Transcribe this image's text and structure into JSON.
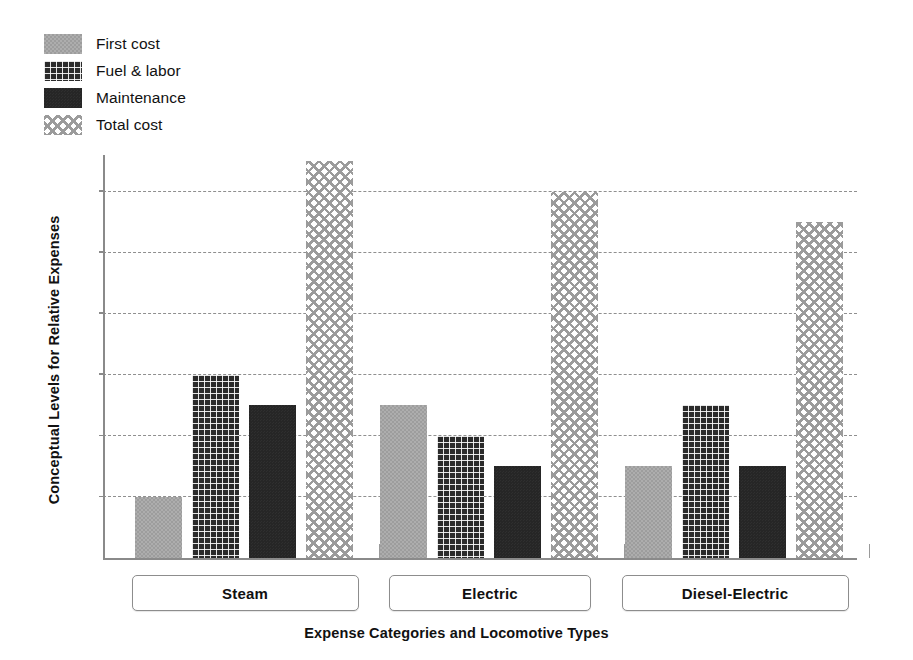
{
  "chart_data": {
    "type": "bar",
    "title": "",
    "subtitle": "",
    "xlabel": "Expense Categories and Locomotive Types",
    "ylabel": "Conceptual Levels for Relative Expenses",
    "categories": [
      "Steam",
      "Electric",
      "Diesel-Electric"
    ],
    "series": [
      {
        "name": "First cost",
        "pattern": "solid-gray",
        "color": "#9d9d9d",
        "values": [
          1.0,
          2.5,
          1.5
        ]
      },
      {
        "name": "Fuel & labor",
        "pattern": "dark-grid",
        "color": "#2b2b2b",
        "values": [
          3.0,
          2.0,
          2.5
        ]
      },
      {
        "name": "Maintenance",
        "pattern": "solid-dark",
        "color": "#262626",
        "values": [
          2.5,
          1.5,
          1.5
        ]
      },
      {
        "name": "Total cost",
        "pattern": "light-crosshatch",
        "color": "#9b9b9b",
        "values": [
          6.5,
          6.0,
          5.5
        ]
      }
    ],
    "ylim": [
      0,
      6.6
    ],
    "yticks": [
      1,
      2,
      3,
      4,
      5,
      6
    ],
    "ytick_labels": [
      "",
      "",
      "",
      "",
      "",
      ""
    ],
    "grid": true,
    "grid_style": "dashed",
    "legend_position": "top-left",
    "axis_color": "#8a8a8a",
    "grid_color": "#8f8f8f",
    "background": "#ffffff"
  },
  "legend": {
    "items": [
      {
        "label": "First cost",
        "swatch": "pat-first"
      },
      {
        "label": "Fuel & labor",
        "swatch": "pat-fuel"
      },
      {
        "label": "Maintenance",
        "swatch": "pat-maint"
      },
      {
        "label": "Total cost",
        "swatch": "pat-total"
      }
    ]
  },
  "axes": {
    "x_title": "Expense Categories and Locomotive Types",
    "y_title": "Conceptual Levels for Relative Expenses"
  },
  "category_boxes": [
    {
      "label": "Steam"
    },
    {
      "label": "Electric"
    },
    {
      "label": "Diesel-Electric"
    }
  ]
}
